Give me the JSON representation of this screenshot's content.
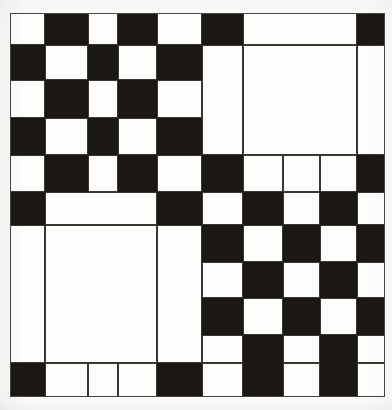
{
  "image": {
    "kind": "checkerboard-calibration-pattern",
    "width": 392,
    "height": 410,
    "background_color": "#fbfbfa",
    "black_color": "#1a1715",
    "white_color": "#fdfdfc",
    "line_color": "#3a3633",
    "frame": {
      "x": 10,
      "y": 13,
      "width": 375,
      "height": 384
    }
  },
  "grid": {
    "column_edges": [
      10,
      45,
      88,
      118,
      157,
      202,
      243,
      283,
      320,
      357,
      385
    ],
    "row_edges": [
      13,
      45,
      80,
      118,
      155,
      192,
      225,
      262,
      298,
      335,
      363,
      397
    ],
    "columns": 10,
    "rows": 11
  },
  "chart_data": {
    "type": "heatmap",
    "title": "",
    "xlabel": "",
    "ylabel": "",
    "legend": [],
    "grid": true,
    "x": [
      10,
      45,
      88,
      118,
      157,
      202,
      243,
      283,
      320,
      357,
      385
    ],
    "y": [
      13,
      45,
      80,
      118,
      155,
      192,
      225,
      262,
      298,
      335,
      363,
      397
    ],
    "values": [
      [
        "w",
        "k",
        "w",
        "k",
        "w",
        "k",
        "w",
        "w",
        "w",
        "k"
      ],
      [
        "k",
        "w",
        "k",
        "w",
        "k",
        "w",
        "w",
        "w",
        "w",
        "w"
      ],
      [
        "w",
        "k",
        "w",
        "k",
        "w",
        "w",
        "w",
        "w",
        "w",
        "w"
      ],
      [
        "k",
        "w",
        "k",
        "w",
        "k",
        "w",
        "w",
        "w",
        "w",
        "w"
      ],
      [
        "w",
        "k",
        "w",
        "k",
        "w",
        "k",
        "w",
        "w",
        "w",
        "k"
      ],
      [
        "k",
        "w",
        "w",
        "w",
        "k",
        "w",
        "k",
        "w",
        "k",
        "w"
      ],
      [
        "w",
        "w",
        "w",
        "w",
        "w",
        "k",
        "w",
        "k",
        "w",
        "k"
      ],
      [
        "w",
        "w",
        "w",
        "w",
        "w",
        "w",
        "k",
        "w",
        "k",
        "w"
      ],
      [
        "w",
        "w",
        "w",
        "w",
        "w",
        "k",
        "w",
        "k",
        "w",
        "k"
      ],
      [
        "w",
        "w",
        "w",
        "w",
        "w",
        "w",
        "k",
        "w",
        "k",
        "w"
      ],
      [
        "k",
        "w",
        "w",
        "w",
        "k",
        "w",
        "k",
        "w",
        "k",
        "w"
      ]
    ],
    "blocks": [
      {
        "name": "top-right-large-white-square",
        "col_start": 6,
        "col_end": 9,
        "row_start": 1,
        "row_end": 4
      },
      {
        "name": "top-right-white-banner",
        "col_start": 6,
        "col_end": 9,
        "row_start": 0,
        "row_end": 1
      },
      {
        "name": "bottom-left-large-white-square",
        "col_start": 1,
        "col_end": 4,
        "row_start": 6,
        "row_end": 10
      },
      {
        "name": "mid-left-white-bar",
        "col_start": 1,
        "col_end": 4,
        "row_start": 5,
        "row_end": 6
      },
      {
        "name": "left-tall-white-strip",
        "col_start": 0,
        "col_end": 1,
        "row_start": 6,
        "row_end": 10
      },
      {
        "name": "col4-tall-white-strip",
        "col_start": 4,
        "col_end": 5,
        "row_start": 6,
        "row_end": 10
      },
      {
        "name": "col5-tall-white-strip",
        "col_start": 5,
        "col_end": 6,
        "row_start": 1,
        "row_end": 4
      },
      {
        "name": "col9-tall-white-strip",
        "col_start": 9,
        "col_end": 10,
        "row_start": 1,
        "row_end": 4
      }
    ],
    "value_legend": {
      "k": "black",
      "w": "white"
    },
    "color_map": {
      "k": "#1a1715",
      "w": "#fdfdfc"
    }
  }
}
